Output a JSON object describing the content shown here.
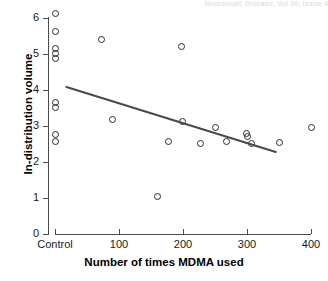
{
  "header": {
    "cut_off_text": "Neurologic Disease, Vol 30, Issue 4"
  },
  "chart_data": {
    "type": "scatter",
    "title": "",
    "xlabel": "Number of times MDMA used",
    "ylabel": "In-distribution volume",
    "xlim": [
      -40,
      420
    ],
    "ylim": [
      0,
      6.3
    ],
    "grid": false,
    "legend": "none",
    "x_tick_labels": [
      "Control",
      "100",
      "200",
      "300",
      "400"
    ],
    "x_tick_values": [
      0,
      100,
      200,
      300,
      400
    ],
    "y_tick_labels": [
      "0",
      "1",
      "2",
      "3",
      "4",
      "5",
      "6"
    ],
    "y_tick_values": [
      0,
      1,
      2,
      3,
      4,
      5,
      6
    ],
    "series": [
      {
        "name": "Participants",
        "marker": "open-circle",
        "color": "#2b2b2b",
        "points": [
          {
            "x": 0,
            "y": 6.12
          },
          {
            "x": 0,
            "y": 5.62
          },
          {
            "x": 0,
            "y": 5.16
          },
          {
            "x": 0,
            "y": 5.02
          },
          {
            "x": 0,
            "y": 4.88
          },
          {
            "x": 0,
            "y": 3.66
          },
          {
            "x": 0,
            "y": 3.52
          },
          {
            "x": 0,
            "y": 2.76
          },
          {
            "x": 0,
            "y": 2.58
          },
          {
            "x": 72,
            "y": 5.4
          },
          {
            "x": 90,
            "y": 3.17
          },
          {
            "x": 160,
            "y": 1.05
          },
          {
            "x": 178,
            "y": 2.58
          },
          {
            "x": 197,
            "y": 5.22
          },
          {
            "x": 199,
            "y": 3.12
          },
          {
            "x": 228,
            "y": 2.52
          },
          {
            "x": 250,
            "y": 2.96
          },
          {
            "x": 268,
            "y": 2.56
          },
          {
            "x": 299,
            "y": 2.8
          },
          {
            "x": 301,
            "y": 2.72
          },
          {
            "x": 307,
            "y": 2.51
          },
          {
            "x": 350,
            "y": 2.54
          },
          {
            "x": 400,
            "y": 2.97
          }
        ]
      }
    ],
    "trendline": {
      "type": "linear-fit",
      "color": "#4a4a4a",
      "x_start": 18,
      "y_start": 4.08,
      "x_end": 345,
      "y_end": 2.28
    }
  }
}
